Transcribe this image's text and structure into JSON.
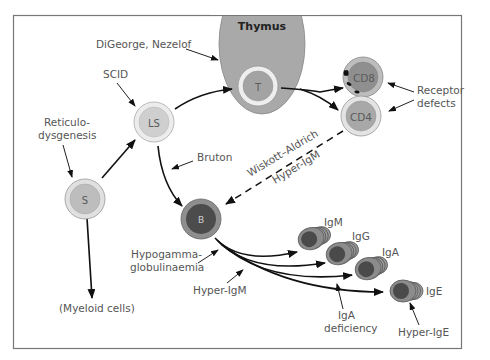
{
  "diagram": {
    "colors": {
      "frame": "#777777",
      "thymus": "#a9a9a9",
      "cell_light_outer": "#e6e6e6",
      "cell_light_inner": "#c4c4c4",
      "cell_dark_outer": "#8c8c8c",
      "cell_dark_inner": "#4a4a4a",
      "text": "#555555",
      "arrow": "#111111"
    },
    "thymus": {
      "label": "Thymus"
    },
    "cells": {
      "stem": {
        "label": "S"
      },
      "lymphoid_stem": {
        "label": "LS"
      },
      "t_cell": {
        "label": "T"
      },
      "cd8": {
        "label": "CD8"
      },
      "cd4": {
        "label": "CD4"
      },
      "b_cell": {
        "label": "B"
      },
      "plasma": [
        {
          "label": "IgM"
        },
        {
          "label": "IgG"
        },
        {
          "label": "IgA"
        },
        {
          "label": "IgE"
        }
      ]
    },
    "defects": {
      "digeorge": "DiGeorge, Nezelof",
      "scid": "SCID",
      "reticular_line1": "Reticulo-",
      "reticular_line2": "dysgenesis",
      "bruton": "Bruton",
      "receptor_line1": "Receptor",
      "receptor_line2": "defects",
      "wiskott": "Wiskott–Aldrich",
      "hyper_igm_dashed": "Hyper-IgM",
      "hypogamma_line1": "Hypogamma-",
      "hypogamma_line2": "globulinaemia",
      "hyper_igm": "Hyper-IgM",
      "iga_def_line1": "IgA",
      "iga_def_line2": "deficiency",
      "hyper_ige": "Hyper-IgE"
    },
    "myeloid": "(Myeloid cells)"
  }
}
